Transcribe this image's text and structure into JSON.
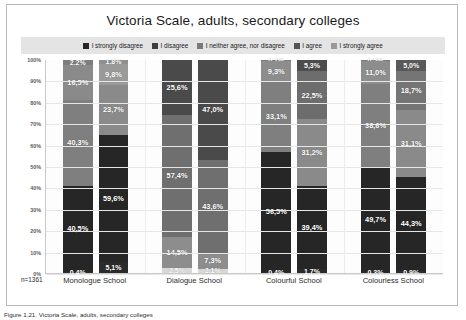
{
  "chart_data": {
    "type": "bar",
    "subtype": "stacked-percent-100",
    "title": "Victoria Scale, adults, secondary colleges",
    "xlabel": "",
    "ylabel": "",
    "ylim": [
      0,
      100
    ],
    "ytick_labels": [
      "100%",
      "90%",
      "80%",
      "70%",
      "60%",
      "50%",
      "40%",
      "30%",
      "20%",
      "10%",
      "0%"
    ],
    "grid": true,
    "legend_position": "top",
    "sample_note": "n=1361",
    "categories": [
      "Monologue School",
      "Dialogue School",
      "Colourful School",
      "Colourless School"
    ],
    "legend": [
      {
        "label": "I strongly disagree",
        "color": "#262626"
      },
      {
        "label": "I disagree",
        "color": "#3f3f3f"
      },
      {
        "label": "I neither agree, nor disagree",
        "color": "#7a7a7a"
      },
      {
        "label": "I agree",
        "color": "#555555"
      },
      {
        "label": "I strongly agree",
        "color": "#9a9a9a"
      }
    ],
    "groups": [
      {
        "category": "Monologue School",
        "bars": [
          {
            "segments": [
              {
                "series": "I strongly disagree",
                "value": 0.4,
                "label": "0,4%",
                "color": "#2b2b2b"
              },
              {
                "series": "I disagree",
                "value": 40.5,
                "label": "40,5%",
                "color": "#262626"
              },
              {
                "series": "I neither agree, nor disagree",
                "value": 40.3,
                "label": "40,3%",
                "color": "#7f7f7f"
              },
              {
                "series": "I agree",
                "value": 16.5,
                "label": "16,5%",
                "color": "#8a8a8a"
              },
              {
                "series": "I strongly agree",
                "value": 2.2,
                "label": "2,2%",
                "color": "#7d7d7d"
              }
            ]
          },
          {
            "segments": [
              {
                "series": "I strongly disagree",
                "value": 5.1,
                "label": "5,1%",
                "color": "#2b2b2b"
              },
              {
                "series": "I disagree",
                "value": 59.6,
                "label": "59,6%",
                "color": "#262626"
              },
              {
                "series": "I neither agree, nor disagree",
                "value": 23.7,
                "label": "23,7%",
                "color": "#8a8a8a"
              },
              {
                "series": "I agree",
                "value": 9.8,
                "label": "9,8%",
                "color": "#9a9a9a"
              },
              {
                "series": "I strongly agree",
                "value": 1.8,
                "label": "1,8%",
                "color": "#8f8f8f"
              }
            ]
          }
        ]
      },
      {
        "category": "Dialogue School",
        "bars": [
          {
            "segments": [
              {
                "series": "I strongly disagree",
                "value": 2.5,
                "label": "2,5%",
                "color": "#d8d8d8"
              },
              {
                "series": "I disagree",
                "value": 14.5,
                "label": "14,5%",
                "color": "#8d8d8d"
              },
              {
                "series": "I neither agree, nor disagree",
                "value": 57.4,
                "label": "57,4%",
                "color": "#6f6f6f"
              },
              {
                "series": "I agree",
                "value": 25.6,
                "label": "25,6%",
                "color": "#4a4a4a"
              },
              {
                "series": "I strongly agree",
                "value": 0.0,
                "label": "",
                "color": "#4a4a4a"
              }
            ]
          },
          {
            "segments": [
              {
                "series": "I strongly disagree",
                "value": 2.1,
                "label": "2,1%",
                "color": "#d8d8d8"
              },
              {
                "series": "I disagree",
                "value": 7.3,
                "label": "7,3%",
                "color": "#8d8d8d"
              },
              {
                "series": "I neither agree, nor disagree",
                "value": 43.6,
                "label": "43,6%",
                "color": "#6f6f6f"
              },
              {
                "series": "I agree",
                "value": 47.0,
                "label": "47,0%",
                "color": "#4a4a4a"
              },
              {
                "series": "I strongly agree",
                "value": 0.0,
                "label": "",
                "color": "#4a4a4a"
              }
            ]
          }
        ]
      },
      {
        "category": "Colourful School",
        "bars": [
          {
            "segments": [
              {
                "series": "I strongly disagree",
                "value": 0.4,
                "label": "0,4%",
                "color": "#2b2b2b"
              },
              {
                "series": "I disagree",
                "value": 56.5,
                "label": "56,5%",
                "color": "#262626"
              },
              {
                "series": "I neither agree, nor disagree",
                "value": 33.1,
                "label": "33,1%",
                "color": "#7f7f7f"
              },
              {
                "series": "I agree",
                "value": 9.3,
                "label": "9,3%",
                "color": "#8d8d8d"
              },
              {
                "series": "I strongly agree",
                "value": 0.7,
                "label": "0,7%",
                "color": "#7a7a7a"
              }
            ]
          },
          {
            "segments": [
              {
                "series": "I strongly disagree",
                "value": 1.7,
                "label": "1,7%",
                "color": "#2b2b2b"
              },
              {
                "series": "I disagree",
                "value": 39.4,
                "label": "39,4%",
                "color": "#262626"
              },
              {
                "series": "I neither agree, nor disagree",
                "value": 31.2,
                "label": "31,2%",
                "color": "#8a8a8a"
              },
              {
                "series": "I agree",
                "value": 22.5,
                "label": "22,5%",
                "color": "#6d6d6d"
              },
              {
                "series": "I strongly agree",
                "value": 5.3,
                "label": "5,3%",
                "color": "#4d4d4d"
              }
            ]
          }
        ]
      },
      {
        "category": "Colourless School",
        "bars": [
          {
            "segments": [
              {
                "series": "I strongly disagree",
                "value": 0.3,
                "label": "0,3%",
                "color": "#2b2b2b"
              },
              {
                "series": "I disagree",
                "value": 49.7,
                "label": "49,7%",
                "color": "#262626"
              },
              {
                "series": "I neither agree, nor disagree",
                "value": 38.6,
                "label": "38,6%",
                "color": "#7f7f7f"
              },
              {
                "series": "I agree",
                "value": 11.0,
                "label": "11,0%",
                "color": "#8d8d8d"
              },
              {
                "series": "I strongly agree",
                "value": 0.5,
                "label": "0,5%",
                "color": "#7a7a7a"
              }
            ]
          },
          {
            "segments": [
              {
                "series": "I strongly disagree",
                "value": 0.9,
                "label": "0,9%",
                "color": "#2b2b2b"
              },
              {
                "series": "I disagree",
                "value": 44.3,
                "label": "44,3%",
                "color": "#262626"
              },
              {
                "series": "I neither agree, nor disagree",
                "value": 31.1,
                "label": "31,1%",
                "color": "#8a8a8a"
              },
              {
                "series": "I agree",
                "value": 18.7,
                "label": "18,7%",
                "color": "#757575"
              },
              {
                "series": "I strongly agree",
                "value": 5.0,
                "label": "5,0%",
                "color": "#5a5a5a"
              }
            ]
          }
        ]
      }
    ]
  },
  "caption": "Figure 1.21. Victoria Scale, adults, secondary colleges"
}
